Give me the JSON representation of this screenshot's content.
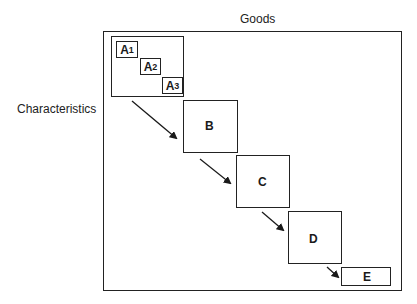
{
  "diagram": {
    "axis_labels": {
      "top": "Goods",
      "left": "Characteristics"
    },
    "group_A": {
      "items": [
        {
          "letter": "A",
          "subscript": "1"
        },
        {
          "letter": "A",
          "subscript": "2"
        },
        {
          "letter": "A",
          "subscript": "3"
        }
      ]
    },
    "blocks": [
      {
        "label": "B"
      },
      {
        "label": "C"
      },
      {
        "label": "D"
      },
      {
        "label": "E"
      }
    ],
    "arrows": [
      "A-to-B",
      "B-to-C",
      "C-to-D",
      "D-to-E"
    ]
  }
}
